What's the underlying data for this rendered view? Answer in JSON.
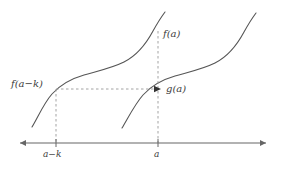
{
  "figure": {
    "type": "function-graph-diagram",
    "background_color": "#ffffff",
    "curve_color": "#555555",
    "axis_color": "#666666",
    "dashed_color": "#999999",
    "label_color": "#3d3d3d",
    "labels": {
      "f_a_minus_k": "f(a−k)",
      "f_a": "f(a)",
      "g_a": "g(a)"
    },
    "axis": {
      "tick_labels": [
        "a−k",
        "a"
      ],
      "left_arrow": true,
      "right_arrow": true
    },
    "annotations": {
      "horizontal_dashed_arrow": "arrow from f(a−k) on curve f to g(a) on curve g",
      "vertical_dashed_left": "dashed line from f(a−k) point down to tick a−k",
      "vertical_dashed_right": "dashed line from f(a) point down to tick a"
    },
    "curves": [
      {
        "name": "f",
        "description": "sigmoid curve, left"
      },
      {
        "name": "g",
        "description": "sigmoid curve, shifted right and down"
      }
    ]
  }
}
